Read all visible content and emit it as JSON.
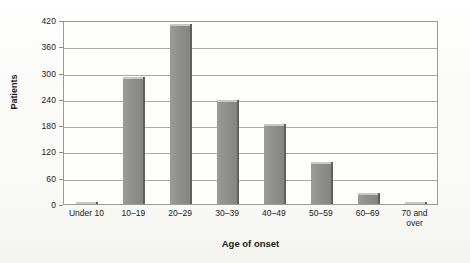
{
  "chart_data": {
    "type": "bar",
    "title": "",
    "xlabel": "Age of onset",
    "ylabel": "Patients",
    "categories": [
      "Under 10",
      "10–19",
      "20–29",
      "30–39",
      "40–49",
      "50–59",
      "60–69",
      "70 and\nover"
    ],
    "values": [
      4,
      290,
      412,
      238,
      183,
      95,
      25,
      5
    ],
    "ylim": [
      0,
      420
    ],
    "yticks": [
      0,
      60,
      120,
      180,
      240,
      300,
      360,
      420
    ],
    "ytick_labels": [
      "0",
      "60",
      "120",
      "180",
      "240",
      "300",
      "360",
      "420"
    ],
    "grid": "horizontal",
    "legend": "none",
    "bar_color": "#8e8e8a",
    "bar_top_color": "#c8c8c4",
    "bar_shadow_color": "#5f5f5d",
    "gridline_color": "#a9a9a5",
    "axis_color": "#9a9a96",
    "plot_background": "#fdfdfb",
    "figure_background": "#fbfbf9",
    "text_color": "#23201e"
  }
}
